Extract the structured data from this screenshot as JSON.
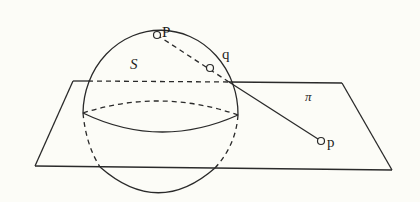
{
  "diagram": {
    "colors": {
      "background": "#fcfcf7",
      "ink": "#2a2a2a"
    },
    "labels": {
      "pole": "P",
      "sphere": "S",
      "sphere_point": "q",
      "plane": "π",
      "plane_point": "p"
    },
    "points": [
      {
        "id": "P",
        "x": 157,
        "y": 35
      },
      {
        "id": "q",
        "x": 210,
        "y": 68
      },
      {
        "id": "p",
        "x": 321,
        "y": 141
      }
    ],
    "plane_corners": [
      {
        "x": 73,
        "y": 81
      },
      {
        "x": 342,
        "y": 83
      },
      {
        "x": 392,
        "y": 170
      },
      {
        "x": 35,
        "y": 166
      }
    ]
  }
}
